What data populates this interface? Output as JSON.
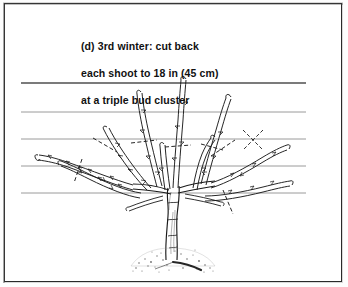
{
  "figure": {
    "label": "(d)",
    "caption_lines": [
      "(d) 3rd winter: cut back",
      "each shoot to 18 in (45 cm)",
      "at a triple bud cluster"
    ],
    "caption_full": "(d) 3rd winter: cut back each shoot to 18 in (45 cm) at a triple bud cluster",
    "measurement_imperial": "18 in",
    "measurement_metric": "45 cm",
    "season": "3rd winter",
    "pruning_target": "triple bud cluster"
  },
  "style": {
    "ink": "#1a1a1a",
    "wire": "#8d8d8d",
    "wire_top": "#4f4f4f",
    "background": "#ffffff",
    "frame": "#2a2a2a",
    "soil": "#6e6e6e"
  },
  "drawing": {
    "support_wires": {
      "name": "horizontal training wires",
      "count": 5,
      "x_start": 16,
      "x_end": 301,
      "y_positions": [
        79,
        108,
        135,
        162,
        189
      ]
    },
    "ground_line": {
      "name": "soil mound",
      "center_x": 168,
      "y": 258
    },
    "trunk": {
      "name": "trunk",
      "base_x": 168,
      "base_y": 258,
      "top_y": 186
    },
    "shoots": [
      {
        "id": "shoot-l4",
        "side": "left",
        "label": "outer left shoot",
        "cut_mark": true
      },
      {
        "id": "shoot-l3",
        "side": "left",
        "label": "left lower shoot",
        "cut_mark": true
      },
      {
        "id": "shoot-l2",
        "side": "left",
        "label": "left mid shoot",
        "cut_mark": true
      },
      {
        "id": "shoot-l1",
        "side": "left",
        "label": "left upper shoot",
        "cut_mark": true
      },
      {
        "id": "shoot-c1",
        "side": "centre",
        "label": "central shoot",
        "cut_mark": true
      },
      {
        "id": "shoot-r1",
        "side": "right",
        "label": "right upper shoot",
        "cut_mark": true
      },
      {
        "id": "shoot-r2",
        "side": "right",
        "label": "right mid shoot",
        "cut_mark": true
      },
      {
        "id": "shoot-r3",
        "side": "right",
        "label": "right lower shoot",
        "cut_mark": true
      },
      {
        "id": "shoot-r4",
        "side": "right",
        "label": "outer right shoot",
        "cut_mark": true
      }
    ],
    "cut_marks": {
      "name": "pruning cut indicators",
      "style": "dashed crossing stroke",
      "count": 9
    }
  }
}
